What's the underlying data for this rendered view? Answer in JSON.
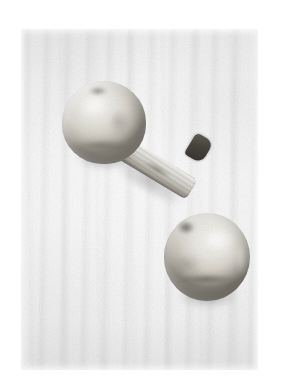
{
  "image": {
    "kind": "photograph",
    "subject": "two-mushrooms",
    "caption": "Two pale mushrooms on a light vertically textured surface",
    "palette": {
      "page_background": "#ffffff",
      "plate_background": "#f2f2f2",
      "cap_highlight": "#f4f3ef",
      "cap_midtone": "#d6d2c9",
      "cap_shadow": "#8b867b",
      "stem_highlight": "#f0efec",
      "stem_shadow": "#8e8a80",
      "stem_cut_dark": "#2e2b26",
      "ground_shadow": "#000000"
    },
    "frame": {
      "left": 21,
      "top": 29,
      "width": 237,
      "height": 341
    }
  },
  "objects": {
    "mushroom_one": {
      "label": "Mushroom with stem",
      "position": "upper-left",
      "cap_label": "Mushroom cap",
      "stem_label": "Mushroom stem",
      "stem_tip_label": "Cut stem end",
      "apex_mark_label": "Cap apex depression",
      "shadow_label": "Cast shadow"
    },
    "mushroom_two": {
      "label": "Mushroom cap",
      "position": "lower-right",
      "cap_label": "Mushroom cap",
      "dark_mark_label": "Dark bruise on cap",
      "shadow_label": "Cast shadow"
    }
  },
  "surface": {
    "label": "Textured background surface",
    "texture": "vertical stripes"
  }
}
